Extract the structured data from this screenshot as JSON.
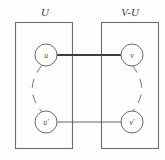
{
  "figure": {
    "background_color": "#fdfdfd",
    "line_color": "#6a6a6a",
    "accent_color": "#3d3d3d"
  },
  "sets": [
    {
      "id": "left-set",
      "label": "U"
    },
    {
      "id": "right-set",
      "label": "V-U"
    }
  ],
  "nodes": [
    {
      "id": "node-u",
      "label": "u",
      "set": "U",
      "position": "top-left"
    },
    {
      "id": "node-v",
      "label": "v",
      "set": "V-U",
      "position": "top-right"
    },
    {
      "id": "node-u-prime",
      "label": "u′",
      "set": "U",
      "position": "bottom-left"
    },
    {
      "id": "node-v-prime",
      "label": "v′",
      "set": "V-U",
      "position": "bottom-right"
    }
  ],
  "edges": [
    {
      "id": "edge-u-v",
      "from": "u",
      "to": "v",
      "style": "solid-thick",
      "label": ""
    },
    {
      "id": "edge-u-v-prime",
      "from": "u′",
      "to": "v′",
      "style": "solid-thin",
      "label": ""
    },
    {
      "id": "arc-u-u-prime",
      "from": "u",
      "to": "u′",
      "style": "dashed-arc-left",
      "label": ""
    },
    {
      "id": "arc-v-v-prime",
      "from": "v",
      "to": "v′",
      "style": "dashed-arc-right",
      "label": ""
    }
  ]
}
